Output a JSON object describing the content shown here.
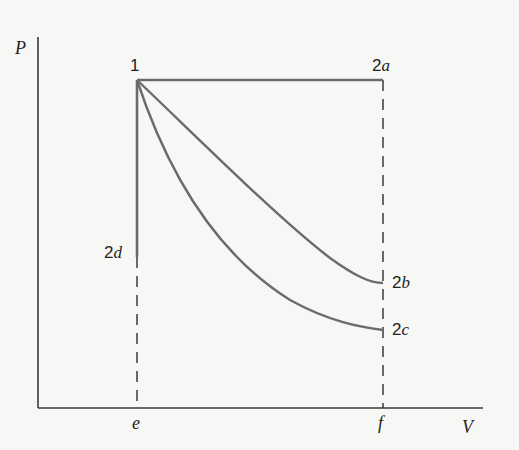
{
  "diagram": {
    "axes": {
      "y_label": "P",
      "x_label": "V",
      "x_ticks": [
        "e",
        "f"
      ]
    },
    "points": {
      "p1": {
        "num": "1",
        "sub": ""
      },
      "p2a": {
        "num": "2",
        "sub": "a"
      },
      "p2b": {
        "num": "2",
        "sub": "b"
      },
      "p2c": {
        "num": "2",
        "sub": "c"
      },
      "p2d": {
        "num": "2",
        "sub": "d"
      }
    },
    "paths": [
      {
        "name": "1-2a",
        "type": "isobaric (horizontal line)"
      },
      {
        "name": "1-2b",
        "type": "curve (upper)"
      },
      {
        "name": "1-2c",
        "type": "curve (lower)"
      },
      {
        "name": "1-2d",
        "type": "isochoric (vertical line)"
      }
    ],
    "colors": {
      "process_line": "#6b6b6b",
      "axis": "#3a3a3a",
      "dashed": "#2e2e2e",
      "background": "#f7f7f5"
    }
  }
}
